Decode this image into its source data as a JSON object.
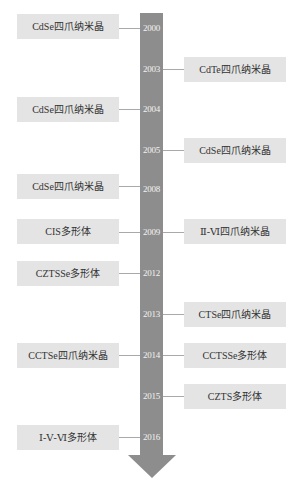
{
  "diagram": {
    "type": "vertical-timeline",
    "colors": {
      "bar": "#8d8d8d",
      "box_fill": "#e4e4e4",
      "text": "#333333",
      "year_text": "#f2f2f2",
      "connector": "#a9a9a9"
    },
    "years": [
      {
        "label": "2000",
        "y": 28
      },
      {
        "label": "2003",
        "y": 69
      },
      {
        "label": "2004",
        "y": 109
      },
      {
        "label": "2005",
        "y": 150
      },
      {
        "label": "2008",
        "y": 189
      },
      {
        "label": "2009",
        "y": 232
      },
      {
        "label": "2012",
        "y": 273
      },
      {
        "label": "2013",
        "y": 314
      },
      {
        "label": "2014",
        "y": 355
      },
      {
        "label": "2015",
        "y": 396
      },
      {
        "label": "2016",
        "y": 437
      }
    ],
    "events": [
      {
        "year": "2000",
        "side": "left",
        "label": "CdSe四爪纳米晶"
      },
      {
        "year": "2003",
        "side": "right",
        "label": "CdTe四爪纳米晶"
      },
      {
        "year": "2004",
        "side": "left",
        "label": "CdSe四爪纳米晶"
      },
      {
        "year": "2005",
        "side": "right",
        "label": "CdSe四爪纳米晶"
      },
      {
        "year": "2008",
        "side": "left",
        "label": "CdSe四爪纳米晶"
      },
      {
        "year": "2009",
        "side": "left",
        "label": "CIS多形体"
      },
      {
        "year": "2009",
        "side": "right",
        "label": "Ⅱ-Ⅵ四爪纳米晶"
      },
      {
        "year": "2012",
        "side": "left",
        "label": "CZTSSe多形体"
      },
      {
        "year": "2013",
        "side": "right",
        "label": "CTSe四爪纳米晶"
      },
      {
        "year": "2014",
        "side": "left",
        "label": "CCTSe四爪纳米晶"
      },
      {
        "year": "2014",
        "side": "right",
        "label": "CCTSSe多形体"
      },
      {
        "year": "2015",
        "side": "right",
        "label": "CZTS多形体"
      },
      {
        "year": "2016",
        "side": "left",
        "label": "Ⅰ-Ⅴ-Ⅵ多形体"
      }
    ]
  }
}
